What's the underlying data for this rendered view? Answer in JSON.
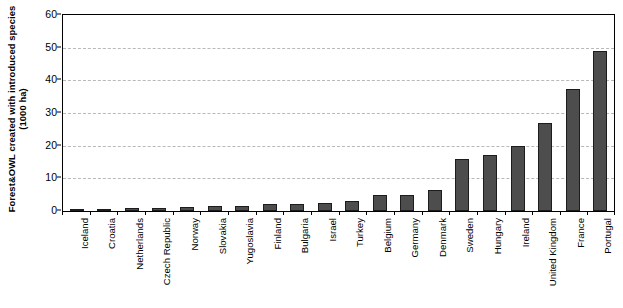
{
  "chart_data": {
    "type": "bar",
    "title": "",
    "subtitle": "",
    "xlabel": "",
    "ylabel": "Forest&OWL created with introduced species (1000 ha)",
    "ylabel_line1": "Forest&OWL created with introduced species",
    "ylabel_line2": "(1000 ha)",
    "ylim": [
      0,
      60
    ],
    "ytick_values": [
      0,
      10,
      20,
      30,
      40,
      50,
      60
    ],
    "ytick_labels": [
      "0",
      "10",
      "20",
      "30",
      "40",
      "50",
      "60"
    ],
    "grid": true,
    "grid_style": "dashed-horizontal",
    "legend": null,
    "categories": [
      "Iceland",
      "Croatia",
      "Netherlands",
      "Czech Republic",
      "Norway",
      "Slovakia",
      "Yugoslavia",
      "Finland",
      "Bulgaria",
      "Israel",
      "Turkey",
      "Belgium",
      "Germany",
      "Denmark",
      "Sweden",
      "Hungary",
      "Ireland",
      "United Kingdom",
      "France",
      "Portugal"
    ],
    "values": [
      0.5,
      0.6,
      0.8,
      1.0,
      1.1,
      1.5,
      1.6,
      2.0,
      2.1,
      2.4,
      3.0,
      5.0,
      5.0,
      6.5,
      16.0,
      17.0,
      20.0,
      27.0,
      37.5,
      49.0
    ],
    "bar_color": "#4d4d4d",
    "bar_edge_color": "#1c1c1c",
    "axis_color": "#000000",
    "gridline_color": "#b9b9b9",
    "background_color": "#ffffff"
  }
}
